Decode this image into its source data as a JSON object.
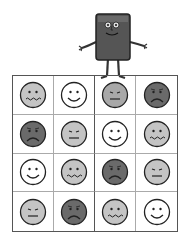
{
  "colors": {
    "white": "#ffffff",
    "light": "#c4c4c4",
    "mid": "#a8a8a8",
    "dark": "#6a6a6a",
    "outline": "#222222"
  },
  "character": {
    "description": "rectangular smiling mascot standing on grid"
  },
  "grid": {
    "rows": 4,
    "cols": 4,
    "cells": [
      [
        {
          "mood": "sick",
          "tone": "light"
        },
        {
          "mood": "happy",
          "tone": "white"
        },
        {
          "mood": "neutral",
          "tone": "mid"
        },
        {
          "mood": "sad",
          "tone": "dark"
        }
      ],
      [
        {
          "mood": "sad",
          "tone": "dark"
        },
        {
          "mood": "neutral",
          "tone": "light"
        },
        {
          "mood": "happy",
          "tone": "white"
        },
        {
          "mood": "sick",
          "tone": "light"
        }
      ],
      [
        {
          "mood": "happy",
          "tone": "white"
        },
        {
          "mood": "sick",
          "tone": "light"
        },
        {
          "mood": "sad",
          "tone": "dark"
        },
        {
          "mood": "neutral",
          "tone": "light"
        }
      ],
      [
        {
          "mood": "neutral",
          "tone": "light"
        },
        {
          "mood": "sad",
          "tone": "dark"
        },
        {
          "mood": "sick",
          "tone": "light"
        },
        {
          "mood": "happy",
          "tone": "white"
        }
      ]
    ]
  }
}
